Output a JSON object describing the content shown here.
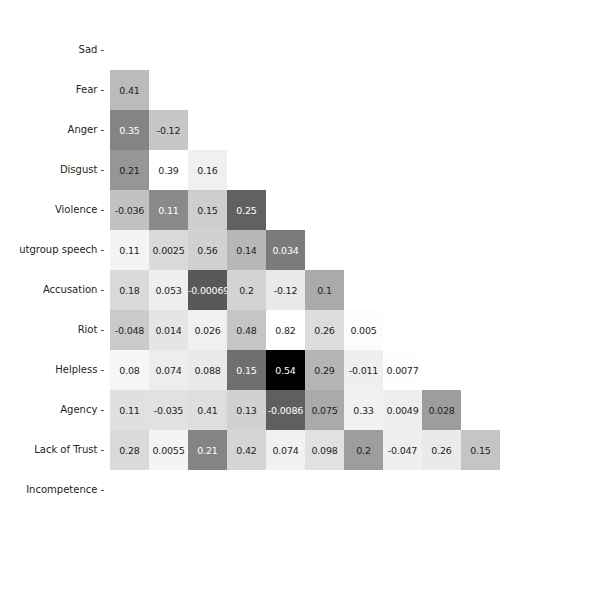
{
  "chart_data": {
    "type": "heatmap",
    "title": "",
    "xlabel": "",
    "ylabel": "",
    "lower_triangle_only": true,
    "colormap": "greys",
    "colorbar": {
      "ticks": [
        "0.0",
        "0.2",
        "0.4",
        "0.6",
        "0.8"
      ],
      "tick_values": [
        0.0,
        0.2,
        0.4,
        0.6,
        0.8
      ],
      "vmin": -0.12,
      "vmax": 0.82,
      "position": "right"
    },
    "x_labels": [
      "Sad",
      "Fear",
      "Anger",
      "Disgust",
      "Violence",
      "tgroup speech",
      "Accusation",
      "Riot",
      "Helpless",
      "Agency",
      "Lack of Trust",
      "Incompetence"
    ],
    "y_labels": [
      "Sad",
      "Fear",
      "Anger",
      "Disgust",
      "Violence",
      "utgroup speech",
      "Accusation",
      "Riot",
      "Helpless",
      "Agency",
      "Lack of Trust",
      "Incompetence"
    ],
    "categories": [
      "Sad",
      "Fear",
      "Anger",
      "Disgust",
      "Violence",
      "Outgroup speech",
      "Accusation",
      "Riot",
      "Helpless",
      "Agency",
      "Lack of Trust",
      "Incompetence"
    ],
    "rows": [
      {
        "label": "Sad",
        "values": []
      },
      {
        "label": "Fear",
        "values": [
          0.24
        ]
      },
      {
        "label": "Anger",
        "values": [
          0.41,
          0.19
        ]
      },
      {
        "label": "Disgust",
        "values": [
          0.35,
          -0.12,
          -0.0024
        ]
      },
      {
        "label": "Violence",
        "values": [
          0.21,
          0.39,
          0.16,
          0.53
        ]
      },
      {
        "label": "Outgroup speech",
        "values": [
          -0.036,
          0.11,
          0.15,
          0.25,
          0.44
        ]
      },
      {
        "label": "Accusation",
        "values": [
          0.11,
          0.0025,
          0.56,
          0.14,
          0.034,
          0.29
        ]
      },
      {
        "label": "Riot",
        "values": [
          0.18,
          0.053,
          -0.00069,
          0.2,
          -0.12,
          0.1,
          -0.1
        ]
      },
      {
        "label": "Helpless",
        "values": [
          -0.048,
          0.014,
          0.026,
          0.48,
          0.82,
          0.26,
          0.005,
          -0.11
        ]
      },
      {
        "label": "Agency",
        "values": [
          0.08,
          0.074,
          0.088,
          0.15,
          0.54,
          0.29,
          -0.011,
          0.0077,
          0.33
        ]
      },
      {
        "label": "Lack of Trust",
        "values": [
          0.11,
          -0.035,
          0.41,
          0.13,
          -0.0086,
          0.075,
          0.33,
          0.0049,
          0.028,
          0.2
        ]
      },
      {
        "label": "Incompetence",
        "values": [
          0.28,
          0.0055,
          0.21,
          0.42,
          0.074,
          0.098,
          0.2,
          -0.047,
          0.26,
          0.15,
          0.19
        ]
      }
    ],
    "row_labels_text": [
      [
        "0.24"
      ],
      [
        "0.41",
        "0.19"
      ],
      [
        "0.35",
        "-0.12",
        "-0.0024"
      ],
      [
        "0.21",
        "0.39",
        "0.16",
        "0.53"
      ],
      [
        "-0.036",
        "0.11",
        "0.15",
        "0.25",
        "0.44"
      ],
      [
        "0.11",
        "0.0025",
        "0.56",
        "0.14",
        "0.034",
        "0.29"
      ],
      [
        "0.18",
        "0.053",
        "-0.00069",
        "0.2",
        "-0.12",
        "0.1",
        "-0.1"
      ],
      [
        "-0.048",
        "0.014",
        "0.026",
        "0.48",
        "0.82",
        "0.26",
        "0.005",
        "-0.11"
      ],
      [
        "0.08",
        "0.074",
        "0.088",
        "0.15",
        "0.54",
        "0.29",
        "-0.011",
        "0.0077",
        "0.33"
      ],
      [
        "0.11",
        "-0.035",
        "0.41",
        "0.13",
        "-0.0086",
        "0.075",
        "0.33",
        "0.0049",
        "0.028",
        "0.2"
      ],
      [
        "0.28",
        "0.0055",
        "0.21",
        "0.42",
        "0.074",
        "0.098",
        "0.2",
        "-0.047",
        "0.26",
        "0.15",
        "0.19"
      ]
    ]
  },
  "figure": {
    "background_color": "#ffffff",
    "text_color": "#231f20",
    "tick_dash": "-"
  }
}
